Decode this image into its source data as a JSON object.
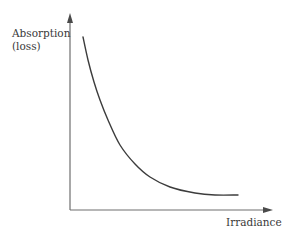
{
  "chart_data": {
    "type": "line",
    "title": "",
    "xlabel": "Irradiance",
    "ylabel_lines": [
      "Absorption",
      "(loss)"
    ],
    "ylabel": "Absorption (loss)",
    "axis_ticks": false,
    "grid": false,
    "legend": null,
    "qualitative": true,
    "series": [
      {
        "name": "absorption",
        "points_px": [
          [
            83,
            37
          ],
          [
            88,
            60
          ],
          [
            94,
            82
          ],
          [
            100,
            100
          ],
          [
            108,
            120
          ],
          [
            120,
            145
          ],
          [
            135,
            164
          ],
          [
            150,
            177
          ],
          [
            170,
            187
          ],
          [
            195,
            193
          ],
          [
            215,
            195
          ],
          [
            238,
            195
          ]
        ]
      }
    ],
    "colors": {
      "axis": "#6e6e6e",
      "curve": "#3c3c3c",
      "text": "#3a3a3a"
    }
  }
}
